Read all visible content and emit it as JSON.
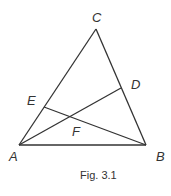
{
  "figure": {
    "caption": "Fig. 3.1",
    "points": {
      "A": {
        "label": "A",
        "x": 19,
        "y": 145
      },
      "B": {
        "label": "B",
        "x": 146,
        "y": 145
      },
      "C": {
        "label": "C",
        "x": 96,
        "y": 29
      },
      "D": {
        "label": "D",
        "x": 121,
        "y": 88
      },
      "E": {
        "label": "E",
        "x": 44,
        "y": 107
      },
      "F": {
        "label": "F",
        "x": 70,
        "y": 116
      }
    },
    "segments": [
      "AB",
      "BC",
      "CA",
      "AD",
      "BE"
    ]
  }
}
